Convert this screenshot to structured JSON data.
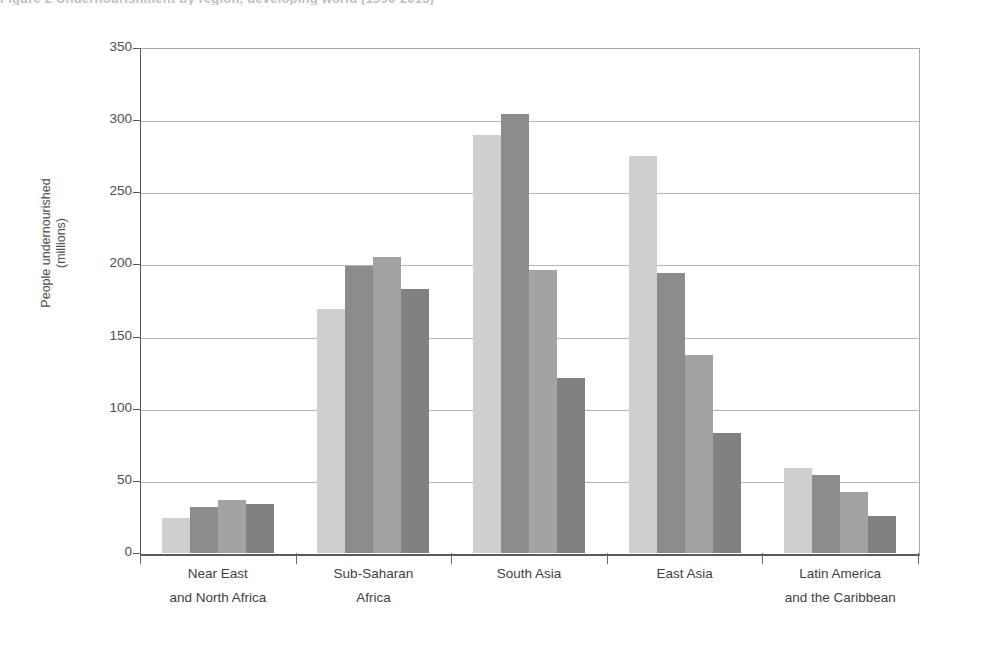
{
  "figure": {
    "caption": "Figure 2   Undernourishment by region, developing world (1990-2015)"
  },
  "chart_data": {
    "type": "bar",
    "title": "",
    "xlabel": "",
    "ylabel": "People undernourished (millions)",
    "ylabel_line1": "People undernourished",
    "ylabel_line2": "(millions)",
    "ylim": [
      0,
      350
    ],
    "ytick_step": 50,
    "yticks": [
      0,
      50,
      100,
      150,
      200,
      250,
      300,
      350
    ],
    "ytick_labels": [
      "0",
      "50",
      "100",
      "150",
      "200",
      "250",
      "300",
      "350"
    ],
    "grid": true,
    "legend": "none",
    "categories": [
      "Near East and North Africa",
      "Sub-Saharan Africa",
      "South Asia",
      "East Asia",
      "Latin America and the Caribbean"
    ],
    "category_lines": [
      [
        "Near East",
        "and North Africa"
      ],
      [
        "Sub-Saharan",
        "Africa"
      ],
      [
        "South Asia",
        ""
      ],
      [
        "East Asia",
        ""
      ],
      [
        "Latin America",
        "and the Caribbean"
      ]
    ],
    "series": [
      {
        "name": "Series 1",
        "color": "#cfcfcf",
        "values": [
          24,
          169,
          290,
          275,
          59
        ]
      },
      {
        "name": "Series 2",
        "color": "#8c8c8c",
        "values": [
          32,
          199,
          304,
          194,
          54
        ]
      },
      {
        "name": "Series 3",
        "color": "#a3a3a3",
        "values": [
          37,
          205,
          196,
          137,
          42
        ]
      },
      {
        "name": "Series 4",
        "color": "#818181",
        "values": [
          34,
          183,
          121,
          83,
          26
        ]
      }
    ]
  }
}
